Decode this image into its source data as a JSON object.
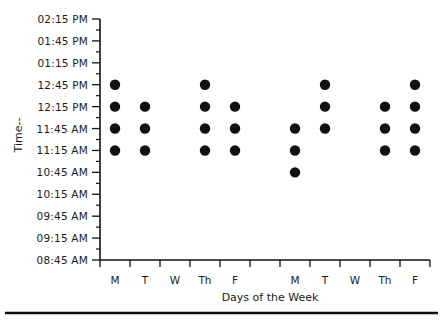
{
  "chart_data": {
    "type": "scatter",
    "title": "",
    "xlabel": "Days of the Week",
    "ylabel": "Time--",
    "categories": [
      "M",
      "T",
      "W",
      "Th",
      "F",
      "",
      "M",
      "T",
      "W",
      "Th",
      "F"
    ],
    "y_ticks": [
      "02:15 PM",
      "01:45 PM",
      "01:15 PM",
      "12:45 PM",
      "12:15 PM",
      "11:45 AM",
      "11:15 AM",
      "10:45 AM",
      "10:15 AM",
      "09:45 AM",
      "09:15 AM",
      "08:45 AM"
    ],
    "ylim": [
      "08:45 AM",
      "02:15 PM"
    ],
    "grid": false,
    "legend": null,
    "series": [
      {
        "name": "Week 1",
        "points": [
          {
            "day": "M",
            "times": [
              "12:45 PM",
              "12:15 PM",
              "11:45 AM",
              "11:15 AM"
            ]
          },
          {
            "day": "T",
            "times": [
              "12:15 PM",
              "11:45 AM",
              "11:15 AM"
            ]
          },
          {
            "day": "W",
            "times": []
          },
          {
            "day": "Th",
            "times": [
              "12:45 PM",
              "12:15 PM",
              "11:45 AM",
              "11:15 AM"
            ]
          },
          {
            "day": "F",
            "times": [
              "12:15 PM",
              "11:45 AM",
              "11:15 AM"
            ]
          }
        ]
      },
      {
        "name": "Week 2",
        "points": [
          {
            "day": "M",
            "times": [
              "11:45 AM",
              "11:15 AM",
              "10:45 AM"
            ]
          },
          {
            "day": "T",
            "times": [
              "12:45 PM",
              "12:15 PM",
              "11:45 AM"
            ]
          },
          {
            "day": "W",
            "times": []
          },
          {
            "day": "Th",
            "times": [
              "12:15 PM",
              "11:45 AM",
              "11:15 AM"
            ]
          },
          {
            "day": "F",
            "times": [
              "12:45 PM",
              "12:15 PM",
              "11:45 AM",
              "11:15 AM"
            ]
          }
        ]
      }
    ]
  },
  "style": {
    "ink": "#111111",
    "background": "#ffffff"
  }
}
